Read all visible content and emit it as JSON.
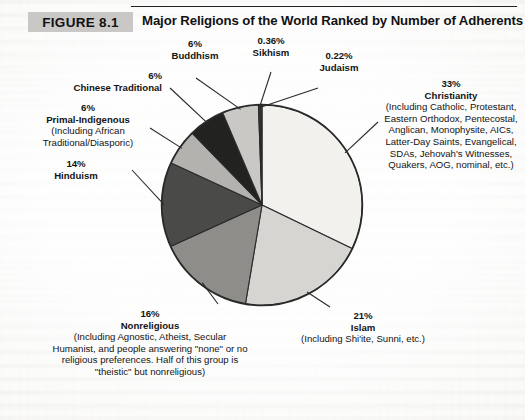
{
  "figure": {
    "badge": "FIGURE 8.1",
    "title": "Major Religions of the World Ranked by Number of Adherents"
  },
  "colors": {
    "page_background": "#f4f3f0",
    "badge_background": "#c9c8c6",
    "text": "#141414",
    "pie_outline": "#2a2a2a"
  },
  "chart_data": {
    "type": "pie",
    "title": "Major Religions of the World Ranked by Number of Adherents",
    "categories": [
      "Christianity",
      "Islam",
      "Nonreligious",
      "Hinduism",
      "Primal-Indigenous",
      "Chinese Traditional",
      "Buddhism",
      "Sikhism",
      "Judaism"
    ],
    "values": [
      33,
      21,
      16,
      14,
      6,
      6,
      6,
      0.36,
      0.22
    ],
    "value_labels": [
      "33%",
      "21%",
      "16%",
      "14%",
      "6%",
      "6%",
      "6%",
      "0.36%",
      "0.22%"
    ],
    "slice_fills": [
      "#f2f1ee",
      "#d6d5d1",
      "#8e8d89",
      "#4a4a48",
      "#b3b2ae",
      "#222220",
      "#c9c8c4",
      "#3a3a38",
      "#6e6d6a"
    ],
    "legend": "none",
    "legend_position": "callout-labels",
    "grid": false,
    "start_angle_deg": -90,
    "direction": "clockwise"
  },
  "callouts": {
    "buddhism": {
      "pct": "6%",
      "name": "Buddhism",
      "sub": ""
    },
    "sikhism": {
      "pct": "0.36%",
      "name": "Sikhism",
      "sub": ""
    },
    "judaism": {
      "pct": "0.22%",
      "name": "Judaism",
      "sub": ""
    },
    "chinese": {
      "pct": "6%",
      "name": "Chinese Traditional",
      "sub": ""
    },
    "primal": {
      "pct": "6%",
      "name": "Primal-Indigenous",
      "sub": "(Including African Traditional/Diasporic)"
    },
    "hinduism": {
      "pct": "14%",
      "name": "Hinduism",
      "sub": ""
    },
    "nonreligious": {
      "pct": "16%",
      "name": "Nonreligious",
      "sub": "(Including Agnostic, Atheist, Secular Humanist, and people answering \"none\" or no religious preferences. Half of this group is \"theistic\" but nonreligious)"
    },
    "islam": {
      "pct": "21%",
      "name": "Islam",
      "sub": "(Including Shi'ite, Sunni, etc.)"
    },
    "christianity": {
      "pct": "33%",
      "name": "Christianity",
      "sub": "(Including Catholic, Protestant, Eastern Orthodox, Pentecostal, Anglican, Monophysite, AICs, Latter-Day Saints, Evangelical, SDAs, Jehovah's Witnesses, Quakers, AOG, nominal, etc.)"
    }
  }
}
